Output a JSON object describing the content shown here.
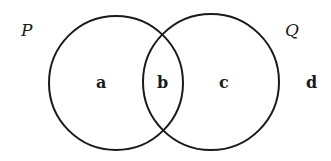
{
  "diagram": {
    "type": "venn",
    "sets": [
      {
        "name": "P",
        "label": "P"
      },
      {
        "name": "Q",
        "label": "Q"
      }
    ],
    "regions": [
      {
        "id": "only-P",
        "label": "a"
      },
      {
        "id": "P-and-Q",
        "label": "b"
      },
      {
        "id": "only-Q",
        "label": "c"
      },
      {
        "id": "outside",
        "label": "d"
      }
    ],
    "line_color": "#1a1a1a",
    "background": "#ffffff"
  }
}
